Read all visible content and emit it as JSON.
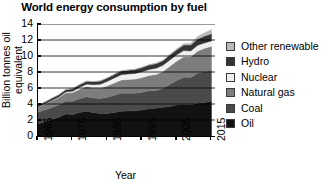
{
  "chart_data": {
    "type": "area",
    "stacked": true,
    "title": "World energy consumption by fuel",
    "xlabel": "Year",
    "ylabel": "Billion tonnes oil equivalent",
    "xlim": [
      1965,
      2016
    ],
    "ylim": [
      0,
      14
    ],
    "yticks": [
      0,
      2,
      4,
      6,
      8,
      10,
      12,
      14
    ],
    "xticks": [
      1965,
      1975,
      1985,
      1995,
      2005,
      2015
    ],
    "grid": "horizontal",
    "legend_position": "right",
    "x": [
      1965,
      1967,
      1969,
      1971,
      1973,
      1975,
      1977,
      1979,
      1981,
      1983,
      1985,
      1987,
      1989,
      1991,
      1993,
      1995,
      1997,
      1999,
      2001,
      2003,
      2005,
      2007,
      2009,
      2011,
      2013,
      2015
    ],
    "series": [
      {
        "name": "Oil",
        "color": "#121212",
        "values": [
          1.53,
          1.78,
          2.07,
          2.35,
          2.75,
          2.7,
          2.95,
          3.1,
          2.92,
          2.8,
          2.8,
          2.95,
          3.1,
          3.12,
          3.15,
          3.25,
          3.4,
          3.48,
          3.58,
          3.7,
          3.9,
          3.98,
          3.92,
          4.08,
          4.18,
          4.33
        ]
      },
      {
        "name": "Coal",
        "color": "#4a4a4a",
        "values": [
          1.45,
          1.47,
          1.5,
          1.52,
          1.58,
          1.65,
          1.72,
          1.8,
          1.82,
          1.9,
          2.05,
          2.15,
          2.25,
          2.22,
          2.2,
          2.22,
          2.25,
          2.2,
          2.35,
          2.78,
          3.05,
          3.35,
          3.4,
          3.75,
          3.88,
          3.84
        ]
      },
      {
        "name": "Natural gas",
        "color": "#7d7d7d",
        "values": [
          0.62,
          0.72,
          0.84,
          0.93,
          1.05,
          1.08,
          1.18,
          1.28,
          1.28,
          1.3,
          1.42,
          1.53,
          1.65,
          1.72,
          1.76,
          1.84,
          1.92,
          2.0,
          2.12,
          2.25,
          2.42,
          2.58,
          2.58,
          2.8,
          2.9,
          3.04
        ]
      },
      {
        "name": "Nuclear",
        "color": "#efefef",
        "values": [
          0.02,
          0.03,
          0.04,
          0.07,
          0.11,
          0.17,
          0.23,
          0.3,
          0.4,
          0.48,
          0.56,
          0.63,
          0.66,
          0.69,
          0.7,
          0.72,
          0.74,
          0.78,
          0.78,
          0.78,
          0.78,
          0.77,
          0.74,
          0.7,
          0.68,
          0.67
        ]
      },
      {
        "name": "Hydro",
        "color": "#343434",
        "values": [
          0.22,
          0.24,
          0.26,
          0.28,
          0.3,
          0.32,
          0.34,
          0.36,
          0.37,
          0.39,
          0.42,
          0.44,
          0.46,
          0.48,
          0.5,
          0.52,
          0.55,
          0.57,
          0.57,
          0.6,
          0.64,
          0.68,
          0.73,
          0.78,
          0.85,
          0.89
        ]
      },
      {
        "name": "Other renewable",
        "color": "#b9b9b9",
        "values": [
          0.0,
          0.0,
          0.0,
          0.0,
          0.01,
          0.01,
          0.01,
          0.02,
          0.02,
          0.03,
          0.04,
          0.04,
          0.05,
          0.06,
          0.06,
          0.07,
          0.08,
          0.09,
          0.1,
          0.12,
          0.14,
          0.18,
          0.23,
          0.32,
          0.42,
          0.54
        ]
      }
    ],
    "legend": [
      {
        "label": "Other renewable",
        "color": "#b9b9b9"
      },
      {
        "label": "Hydro",
        "color": "#343434"
      },
      {
        "label": "Nuclear",
        "color": "#efefef"
      },
      {
        "label": "Natural gas",
        "color": "#7d7d7d"
      },
      {
        "label": "Coal",
        "color": "#4a4a4a"
      },
      {
        "label": "Oil",
        "color": "#121212"
      }
    ]
  }
}
